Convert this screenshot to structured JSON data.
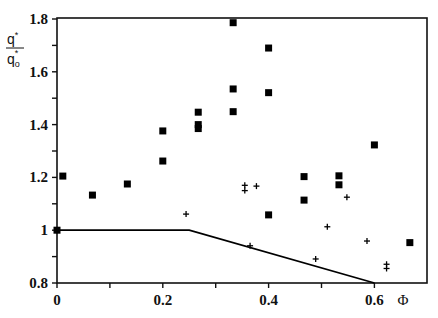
{
  "chart_data": {
    "type": "scatter",
    "title": "",
    "xlabel": "Φ",
    "ylabel": "q* / q0*",
    "ylabel_parts": {
      "numerator": "q",
      "numerator_sup": "*",
      "denominator": "q",
      "denominator_sub": "o",
      "denominator_sup": "*"
    },
    "xlim": [
      0,
      0.7
    ],
    "ylim": [
      0.8,
      1.8
    ],
    "x_ticks": [
      0,
      0.1,
      0.2,
      0.3,
      0.4,
      0.5,
      0.6
    ],
    "x_tick_labels": [
      "0",
      "",
      "0.2",
      "",
      "0.4",
      "",
      "0.6"
    ],
    "y_ticks": [
      0.8,
      0.9,
      1.0,
      1.1,
      1.2,
      1.3,
      1.4,
      1.5,
      1.6,
      1.7,
      1.8
    ],
    "y_tick_labels": [
      "0.8",
      "",
      "1",
      "",
      "1.2",
      "",
      "1.4",
      "",
      "1.6",
      "",
      "1.8"
    ],
    "grid": false,
    "legend": null,
    "series": [
      {
        "name": "squares",
        "marker": "square",
        "color": "#000000",
        "points": [
          {
            "x": 0.0,
            "y": 1.0
          },
          {
            "x": 0.011,
            "y": 1.205
          },
          {
            "x": 0.067,
            "y": 1.133
          },
          {
            "x": 0.133,
            "y": 1.175
          },
          {
            "x": 0.2,
            "y": 1.376
          },
          {
            "x": 0.2,
            "y": 1.262
          },
          {
            "x": 0.267,
            "y": 1.447
          },
          {
            "x": 0.267,
            "y": 1.4
          },
          {
            "x": 0.267,
            "y": 1.385
          },
          {
            "x": 0.333,
            "y": 1.786
          },
          {
            "x": 0.333,
            "y": 1.535
          },
          {
            "x": 0.333,
            "y": 1.449
          },
          {
            "x": 0.4,
            "y": 1.69
          },
          {
            "x": 0.4,
            "y": 1.521
          },
          {
            "x": 0.4,
            "y": 1.058
          },
          {
            "x": 0.467,
            "y": 1.203
          },
          {
            "x": 0.467,
            "y": 1.114
          },
          {
            "x": 0.533,
            "y": 1.206
          },
          {
            "x": 0.533,
            "y": 1.172
          },
          {
            "x": 0.6,
            "y": 1.323
          },
          {
            "x": 0.667,
            "y": 0.953
          }
        ]
      },
      {
        "name": "crosses",
        "marker": "plus",
        "color": "#000000",
        "points": [
          {
            "x": 0.244,
            "y": 1.061
          },
          {
            "x": 0.355,
            "y": 1.17
          },
          {
            "x": 0.355,
            "y": 1.15
          },
          {
            "x": 0.377,
            "y": 1.167
          },
          {
            "x": 0.365,
            "y": 0.941
          },
          {
            "x": 0.489,
            "y": 0.891
          },
          {
            "x": 0.511,
            "y": 1.013
          },
          {
            "x": 0.548,
            "y": 1.125
          },
          {
            "x": 0.586,
            "y": 0.959
          },
          {
            "x": 0.623,
            "y": 0.871
          },
          {
            "x": 0.623,
            "y": 0.855
          }
        ]
      },
      {
        "name": "boundary line",
        "marker": "none",
        "type": "line",
        "color": "#000000",
        "points": [
          {
            "x": 0.0,
            "y": 1.0
          },
          {
            "x": 0.25,
            "y": 1.0
          },
          {
            "x": 0.6,
            "y": 0.8
          }
        ]
      }
    ]
  }
}
